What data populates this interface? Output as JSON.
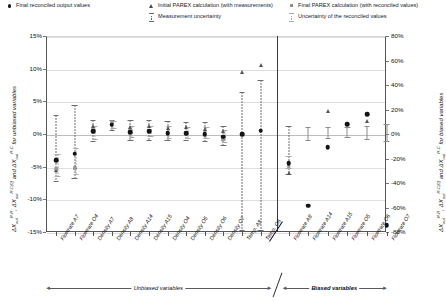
{
  "legend": {
    "items": [
      {
        "id": "final-reconciled-output-values",
        "label": "Final reconciled output values",
        "marker": "dot"
      },
      {
        "id": "initial-parex-calculation",
        "label": "Initial PAREX calculation (with measurements)",
        "marker": "triangle"
      },
      {
        "id": "final-parex-calculation",
        "label": "Final PAREX calculation (with reconciled values)",
        "marker": "square"
      },
      {
        "id": "measurement-uncertainty",
        "label": "Measurement uncertainty",
        "marker": "errorbar-dark"
      },
      {
        "id": "uncertainty-reconciled-values",
        "label": "Uncertainty of the reconciled values",
        "marker": "errorbar-light"
      }
    ]
  },
  "axes": {
    "left_title_parts": {
      "d1": "ΔX",
      "sub1": "out",
      "sup1": "R-R",
      "sep1": ", ",
      "d2": "ΔX",
      "sub2": "out",
      "sup2": "R-C(0)",
      "sep2": " and ",
      "d3": "ΔX",
      "sub3": "out",
      "sup3": "R-C",
      "tail": " for unbiased variables"
    },
    "right_title_parts": {
      "d1": "ΔX",
      "sub1": "out",
      "sup1": "R-R",
      "sep1": ", ",
      "d2": "ΔX",
      "sub2": "out",
      "sup2": "R-C(0)",
      "sep2": " and ",
      "d3": "ΔX",
      "sub3": "out",
      "sup3": "R-C",
      "tail": " for biased variables"
    },
    "left_ticks": [
      "15%",
      "10%",
      "5%",
      "0%",
      "-5%",
      "-10%",
      "-15%"
    ],
    "right_ticks": [
      "80%",
      "60%",
      "40%",
      "20%",
      "0%",
      "-20%",
      "-40%",
      "-60%",
      "-80%"
    ],
    "left_range": [
      -15,
      15
    ],
    "right_range": [
      -80,
      80
    ]
  },
  "groups": {
    "unbiased_label": "Unbiased variables",
    "biased_label": "Biased variables"
  },
  "chart_data": {
    "type": "scatter",
    "title": "",
    "xlabel": "",
    "ylabel": "ΔX_out^R-R, ΔX_out^R-C(0) and ΔX_out^R-C for unbiased variables",
    "ylabel_right": "ΔX_out^R-R, ΔX_out^R-C(0) and ΔX_out^R-C for biased variables",
    "ylim": [
      -15,
      15
    ],
    "ylim_right": [
      -80,
      80
    ],
    "grid": true,
    "legend_position": "top",
    "categories": [
      "Flowrate A7",
      "Flowrate O4",
      "Density A7",
      "Density A8",
      "Density A14",
      "Density A15",
      "Density O4",
      "Density O5",
      "Density O6",
      "Density O7",
      "Temp. A8",
      "Temp. O6",
      "Flowrate A8",
      "Flowrate A14",
      "Flowrate A15",
      "Flowrate O5",
      "Flowrate O6",
      "Flowrate O7"
    ],
    "group_split_after": 12,
    "series": [
      {
        "name": "Final reconciled output values",
        "marker": "dot",
        "values": [
          -4.0,
          -3.0,
          0.4,
          1.4,
          0.3,
          0.4,
          0.1,
          0.1,
          0.0,
          -0.4,
          0.0,
          0.5,
          -4.5,
          -11.0,
          -2.0,
          1.5,
          3.0,
          -14.0
        ]
      },
      {
        "name": "Initial PAREX calculation (with measurements)",
        "marker": "triangle",
        "values": [
          -5.5,
          -5.0,
          1.2,
          1.9,
          1.1,
          1.3,
          0.9,
          1.0,
          0.8,
          0.5,
          9.5,
          10.6,
          -6.0,
          null,
          3.5,
          1.6,
          2.0,
          null
        ]
      },
      {
        "name": "Final PAREX calculation (with reconciled values)",
        "marker": "square",
        "values": [
          -5.3,
          -5.2,
          0.6,
          1.8,
          0.4,
          0.5,
          0.2,
          0.2,
          0.1,
          -0.8,
          null,
          null,
          -5.0,
          null,
          null,
          null,
          null,
          null
        ]
      }
    ],
    "measurement_uncertainty": [
      [
        -7.4,
        2.9
      ],
      [
        -6.9,
        4.4
      ],
      [
        -1.2,
        2.1
      ],
      [
        0.5,
        2.2
      ],
      [
        -1.0,
        2.1
      ],
      [
        -1.0,
        2.1
      ],
      [
        -1.1,
        2.0
      ],
      [
        -1.1,
        1.9
      ],
      [
        -1.2,
        1.8
      ],
      [
        -1.8,
        1.2
      ],
      [
        -14.8,
        6.5
      ],
      [
        -14.8,
        8.2
      ],
      [
        -6.2,
        1.3
      ],
      null,
      null,
      null,
      null,
      null
    ],
    "reconciled_uncertainty": [
      [
        -6.6,
        -3.0
      ],
      [
        -6.2,
        -2.2
      ],
      [
        -0.9,
        1.3
      ],
      [
        0.8,
        2.0
      ],
      [
        -0.6,
        1.3
      ],
      [
        -0.5,
        1.3
      ],
      [
        -0.7,
        1.2
      ],
      [
        -0.7,
        1.1
      ],
      [
        -0.8,
        1.0
      ],
      [
        -1.4,
        0.6
      ],
      null,
      null,
      [
        -5.4,
        -3.4
      ],
      [
        -1.0,
        1.0
      ],
      [
        -0.8,
        1.1
      ],
      [
        -0.6,
        1.0
      ],
      [
        -0.9,
        1.3
      ],
      [
        -1.2,
        1.5
      ]
    ]
  }
}
